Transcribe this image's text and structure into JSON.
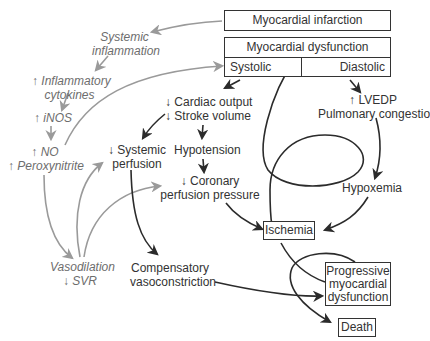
{
  "diagram": {
    "boxes": {
      "myocardial_infarction": "Myocardial infarction",
      "myocardial_dysfunction": "Myocardial dysfunction",
      "systolic": "Systolic",
      "diastolic": "Diastolic",
      "ischemia": "Ischemia",
      "progressive_dysfunction_line1": "Progressive",
      "progressive_dysfunction_line2": "myocardial",
      "progressive_dysfunction_line3": "dysfunction",
      "death": "Death"
    },
    "inflammatory_pathway": {
      "systemic_inflammation_line1": "Systemic",
      "systemic_inflammation_line2": "inflammation",
      "cytokines_line1": "Inflammatory",
      "cytokines_line2": "cytokines",
      "inos": "iNOS",
      "no": "NO",
      "peroxynitrite": "Peroxynitrite",
      "vasodilation": "Vasodilation",
      "svr": "SVR"
    },
    "hemodynamic_pathway": {
      "cardiac_output": "Cardiac output",
      "stroke_volume": "Stroke volume",
      "systemic_perfusion_line1": "Systemic",
      "systemic_perfusion_line2": "perfusion",
      "hypotension": "Hypotension",
      "coronary_line1": "Coronary",
      "coronary_line2": "perfusion pressure",
      "compensatory_line1": "Compensatory",
      "compensatory_line2": "vasoconstriction"
    },
    "diastolic_pathway": {
      "lvedp": "LVEDP",
      "pulmonary_congestion": "Pulmonary congestion",
      "hypoxemia": "Hypoxemia"
    },
    "symbols": {
      "up": "↑",
      "down": "↓"
    },
    "colors": {
      "dark_arrow": "#2b2b2b",
      "gray_arrow": "#9a9a9a",
      "gray_text": "#6d6d6d",
      "box_border": "#333333"
    }
  }
}
